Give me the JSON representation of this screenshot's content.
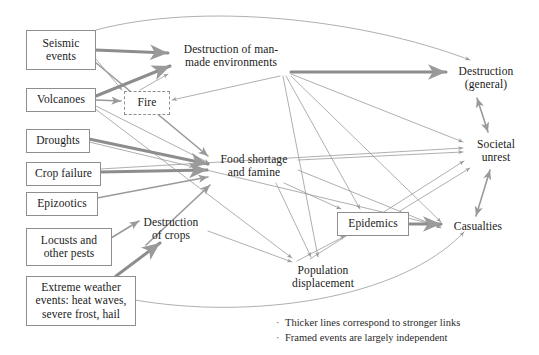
{
  "diagram": {
    "colors": {
      "edge": "#9a9a9a",
      "edge_strong": "#8d8d8d",
      "node_border": "#8e8e8e",
      "text": "#1a1a1a",
      "background": "#ffffff"
    },
    "nodes": [
      {
        "id": "seismic",
        "label": "Seismic\nevents",
        "framed": true,
        "frame_style": "solid",
        "x": 26,
        "y": 30,
        "w": 68,
        "h": 38
      },
      {
        "id": "volcanoes",
        "label": "Volcanoes",
        "framed": true,
        "frame_style": "solid",
        "x": 26,
        "y": 88,
        "w": 68,
        "h": 22
      },
      {
        "id": "droughts",
        "label": "Droughts",
        "framed": true,
        "frame_style": "solid",
        "x": 26,
        "y": 129,
        "w": 62,
        "h": 22
      },
      {
        "id": "cropfailure",
        "label": "Crop failure",
        "framed": true,
        "frame_style": "solid",
        "x": 26,
        "y": 162,
        "w": 73,
        "h": 22
      },
      {
        "id": "epizootics",
        "label": "Epizootics",
        "framed": true,
        "frame_style": "solid",
        "x": 26,
        "y": 192,
        "w": 70,
        "h": 22
      },
      {
        "id": "locusts",
        "label": "Locusts and\nother pests",
        "framed": true,
        "frame_style": "solid",
        "x": 26,
        "y": 228,
        "w": 84,
        "h": 36
      },
      {
        "id": "extreme",
        "label": "Extreme weather\nevents: heat waves,\nsevere frost, hail",
        "framed": true,
        "frame_style": "solid",
        "x": 26,
        "y": 276,
        "w": 108,
        "h": 48
      },
      {
        "id": "fire",
        "label": "Fire",
        "framed": true,
        "frame_style": "dashed",
        "x": 124,
        "y": 91,
        "w": 44,
        "h": 22
      },
      {
        "id": "epidemics",
        "label": "Epidemics",
        "framed": true,
        "frame_style": "solid",
        "x": 337,
        "y": 212,
        "w": 70,
        "h": 22
      },
      {
        "id": "destrman",
        "label": "Destruction of man-\nmade environments",
        "framed": false,
        "frame_style": "none",
        "x": 172,
        "y": 40,
        "w": 118,
        "h": 32
      },
      {
        "id": "foodshort",
        "label": "Food shortage\nand famine",
        "framed": false,
        "frame_style": "none",
        "x": 211,
        "y": 150,
        "w": 86,
        "h": 32
      },
      {
        "id": "destrcrops",
        "label": "Destruction\nof crops",
        "framed": false,
        "frame_style": "none",
        "x": 135,
        "y": 213,
        "w": 72,
        "h": 32
      },
      {
        "id": "popdisp",
        "label": "Population\ndisplacement",
        "framed": false,
        "frame_style": "none",
        "x": 281,
        "y": 261,
        "w": 84,
        "h": 32
      },
      {
        "id": "destrgen",
        "label": "Destruction\n(general)",
        "framed": false,
        "frame_style": "none",
        "x": 448,
        "y": 62,
        "w": 76,
        "h": 32
      },
      {
        "id": "societal",
        "label": "Societal\nunrest",
        "framed": false,
        "frame_style": "none",
        "x": 466,
        "y": 135,
        "w": 60,
        "h": 32
      },
      {
        "id": "casualties",
        "label": "Casualties",
        "framed": false,
        "frame_style": "none",
        "x": 444,
        "y": 219,
        "w": 68,
        "h": 16
      }
    ],
    "edges": [
      {
        "from": "seismic",
        "to": "destrgen",
        "strength": "thin",
        "shape": "curve",
        "path": "M 96 30 C 200 2 360 18 470 60"
      },
      {
        "from": "seismic",
        "to": "destrman",
        "strength": "thick",
        "shape": "line",
        "path": "M 95 50 L 168 53"
      },
      {
        "from": "seismic",
        "to": "fire",
        "strength": "thin",
        "shape": "line",
        "path": "M 95 58 L 122 90"
      },
      {
        "from": "seismic",
        "to": "foodshort",
        "strength": "medium",
        "shape": "line",
        "path": "M 95 62 L 208 156"
      },
      {
        "from": "volcanoes",
        "to": "destrman",
        "strength": "thick",
        "shape": "line",
        "path": "M 96 96 L 170 66"
      },
      {
        "from": "volcanoes",
        "to": "fire",
        "strength": "medium",
        "shape": "line",
        "path": "M 96 100 L 121 101"
      },
      {
        "from": "volcanoes",
        "to": "foodshort",
        "strength": "thin",
        "shape": "line",
        "path": "M 96 106 L 209 163"
      },
      {
        "from": "volcanoes",
        "to": "popdisp",
        "strength": "thin",
        "shape": "line",
        "path": "M 94 108 L 292 258"
      },
      {
        "from": "droughts",
        "to": "foodshort",
        "strength": "thick",
        "shape": "line",
        "path": "M 89 139 L 208 164"
      },
      {
        "from": "droughts",
        "to": "casualties",
        "strength": "thin",
        "shape": "line",
        "path": "M 89 142 L 441 226"
      },
      {
        "from": "cropfailure",
        "to": "foodshort",
        "strength": "thick",
        "shape": "line",
        "path": "M 100 172 L 207 170"
      },
      {
        "from": "cropfailure",
        "to": "societal",
        "strength": "thin",
        "shape": "line",
        "path": "M 100 169 L 463 148"
      },
      {
        "from": "epizootics",
        "to": "foodshort",
        "strength": "medium",
        "shape": "line",
        "path": "M 97 198 L 208 177"
      },
      {
        "from": "locusts",
        "to": "destrcrops",
        "strength": "medium",
        "shape": "line",
        "path": "M 111 238 L 139 221"
      },
      {
        "from": "extreme",
        "to": "destrcrops",
        "strength": "thick",
        "shape": "line",
        "path": "M 116 276 L 160 243"
      },
      {
        "from": "extreme",
        "to": "casualties",
        "strength": "thin",
        "shape": "curve",
        "path": "M 135 300 C 250 320 400 300 464 232"
      },
      {
        "from": "fire",
        "to": "destrman",
        "strength": "thin",
        "shape": "line",
        "path": "M 140 90 L 168 74"
      },
      {
        "from": "destrman",
        "to": "destrgen",
        "strength": "thick",
        "shape": "line",
        "path": "M 291 72 L 446 72"
      },
      {
        "from": "destrman",
        "to": "societal",
        "strength": "thin",
        "shape": "line",
        "path": "M 291 74 L 463 142"
      },
      {
        "from": "destrman",
        "to": "casualties",
        "strength": "thin",
        "shape": "line",
        "path": "M 291 76 L 441 222"
      },
      {
        "from": "destrman",
        "to": "epidemics",
        "strength": "thin",
        "shape": "line",
        "path": "M 286 76 L 360 209"
      },
      {
        "from": "destrman",
        "to": "popdisp",
        "strength": "thin",
        "shape": "line",
        "path": "M 283 76 L 318 257"
      },
      {
        "from": "destrman",
        "to": "fire",
        "strength": "thin",
        "shape": "line",
        "path": "M 280 76 L 172 100"
      },
      {
        "from": "foodshort",
        "to": "societal",
        "strength": "thin",
        "shape": "line",
        "path": "M 298 160 L 463 152"
      },
      {
        "from": "foodshort",
        "to": "casualties",
        "strength": "thin",
        "shape": "line",
        "path": "M 298 170 L 441 228"
      },
      {
        "from": "foodshort",
        "to": "popdisp",
        "strength": "thin",
        "shape": "line",
        "path": "M 276 183 L 311 257"
      },
      {
        "from": "foodshort",
        "to": "epidemics",
        "strength": "thin",
        "shape": "line",
        "path": "M 284 183 L 341 209"
      },
      {
        "from": "destrcrops",
        "to": "foodshort",
        "strength": "medium",
        "shape": "line",
        "path": "M 146 245 L 210 185"
      },
      {
        "from": "destrcrops",
        "to": "popdisp",
        "strength": "thin",
        "shape": "line",
        "path": "M 208 231 L 292 262"
      },
      {
        "from": "popdisp",
        "to": "epidemics",
        "strength": "thin",
        "shape": "line",
        "path": "M 297 261 L 345 236"
      },
      {
        "from": "popdisp",
        "to": "societal",
        "strength": "thin",
        "shape": "line",
        "path": "M 310 259 L 464 161"
      },
      {
        "from": "epidemics",
        "to": "casualties",
        "strength": "thick",
        "shape": "line",
        "path": "M 408 224 L 441 224"
      },
      {
        "from": "epidemics",
        "to": "societal",
        "strength": "thin",
        "shape": "line",
        "path": "M 400 211 L 470 168"
      },
      {
        "from": "casualties",
        "to": "societal",
        "strength": "medium",
        "shape": "bidirectional",
        "path": "M 476 216 L 490 170"
      },
      {
        "from": "societal",
        "to": "destrgen",
        "strength": "medium",
        "shape": "bidirectional",
        "path": "M 488 132 L 477 98"
      }
    ]
  },
  "legend": {
    "items": [
      "Thicker lines correspond to stronger links",
      "Framed events are largely independent"
    ],
    "bullet": "·"
  }
}
